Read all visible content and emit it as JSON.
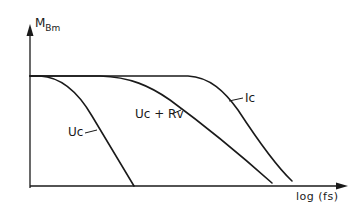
{
  "diagram": {
    "y_axis": {
      "label_main": "M",
      "label_sub": "Bm"
    },
    "x_axis": {
      "label": "log (fs)"
    },
    "curves": [
      {
        "id": "uc",
        "label": "Uc"
      },
      {
        "id": "uc_rv",
        "label": "Uc + Rv"
      },
      {
        "id": "ic",
        "label": "Ic"
      }
    ],
    "colors": {
      "line": "#1a1a1a",
      "background": "#ffffff"
    }
  }
}
